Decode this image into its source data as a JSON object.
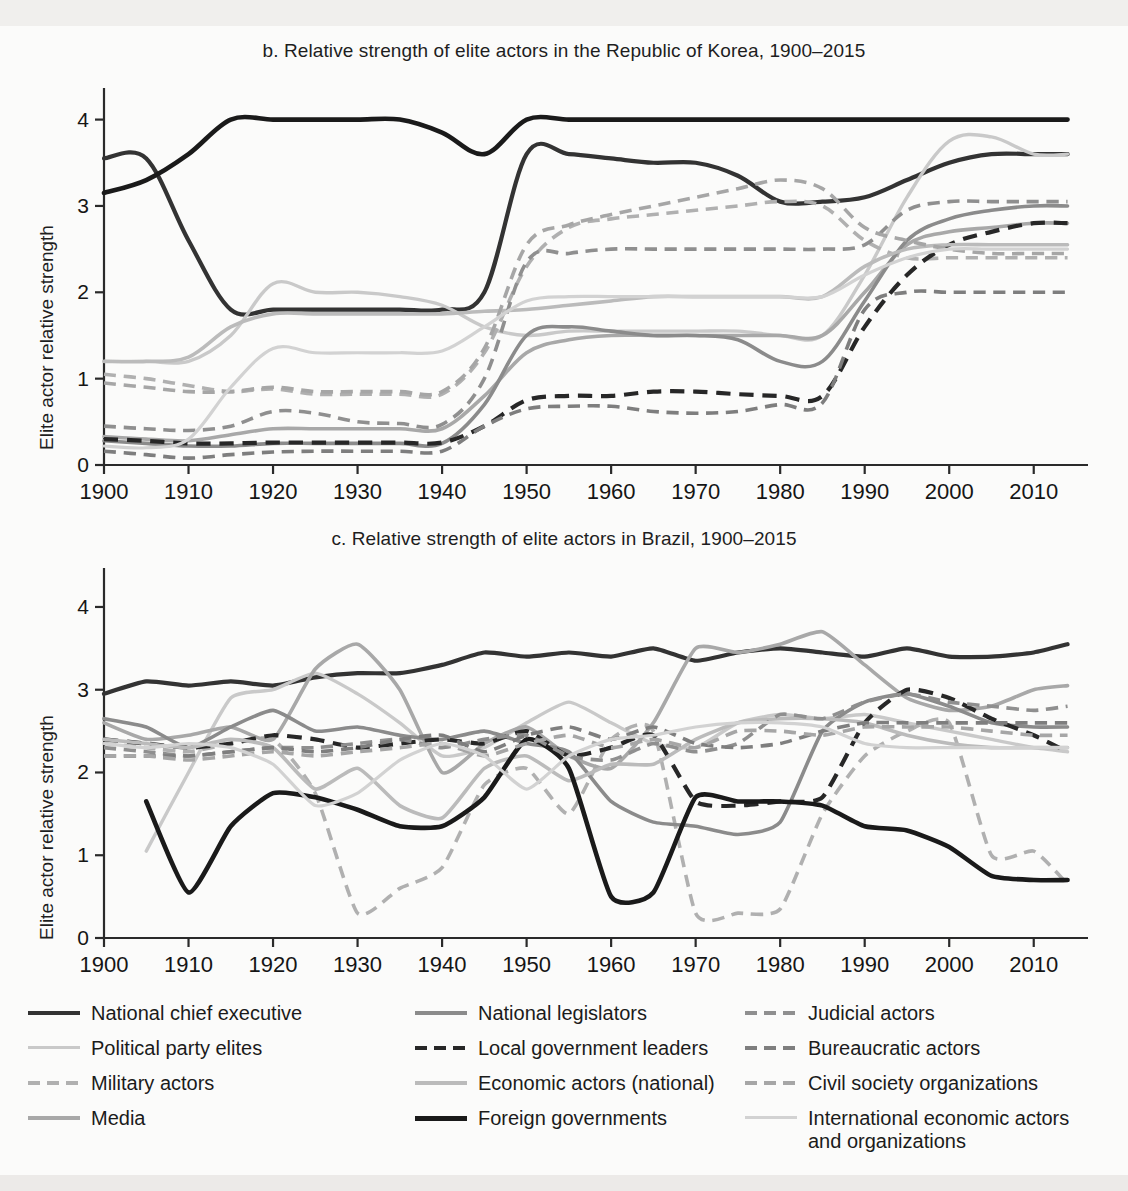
{
  "figure": {
    "background": "#fbfbfa",
    "panels": [
      {
        "id": "korea",
        "title": "b. Relative strength of elite actors in the Republic of Korea, 1900–2015",
        "ylabel": "Elite actor relative strength"
      },
      {
        "id": "brazil",
        "title": "c. Relative strength of elite actors in Brazil, 1900–2015",
        "ylabel": "Elite actor relative strength"
      }
    ]
  },
  "legend": {
    "columns": [
      {
        "items": [
          {
            "label": "National chief executive",
            "style": "solid",
            "color": "#333333",
            "width": 4.2
          },
          {
            "label": "Political party elites",
            "style": "solid",
            "color": "#c9c9c9",
            "width": 3.4
          },
          {
            "label": "Military actors",
            "style": "dashed",
            "color": "#b0b0b0",
            "width": 3.6
          },
          {
            "label": "Media",
            "style": "solid",
            "color": "#a8a8a8",
            "width": 3.6
          }
        ]
      },
      {
        "items": [
          {
            "label": "National legislators",
            "style": "solid",
            "color": "#8b8b8b",
            "width": 3.6
          },
          {
            "label": "Local government leaders",
            "style": "dashed",
            "color": "#272727",
            "width": 4.2
          },
          {
            "label": "Economic actors (national)",
            "style": "solid",
            "color": "#bbbbbb",
            "width": 3.6
          },
          {
            "label": "Foreign governments",
            "style": "solid",
            "color": "#1a1a1a",
            "width": 4.6
          }
        ]
      },
      {
        "items": [
          {
            "label": "Judicial actors",
            "style": "dashed",
            "color": "#8f8f8f",
            "width": 3.6
          },
          {
            "label": "Bureaucratic actors",
            "style": "dashed",
            "color": "#7e7e7e",
            "width": 3.6
          },
          {
            "label": "Civil society organizations",
            "style": "dashed",
            "color": "#a6a6a6",
            "width": 3.6
          },
          {
            "label": "International economic actors\nand organizations",
            "style": "solid",
            "color": "#d2d2d2",
            "width": 3.2
          }
        ]
      }
    ]
  },
  "chart_data": [
    {
      "id": "korea",
      "type": "line",
      "title": "b. Relative strength of elite actors in the Republic of Korea, 1900–2015",
      "xlabel": "",
      "ylabel": "Elite actor relative strength",
      "xlim": [
        1900,
        2015
      ],
      "ylim": [
        0,
        4.25
      ],
      "xticks": [
        1900,
        1910,
        1920,
        1930,
        1940,
        1950,
        1960,
        1970,
        1980,
        1990,
        2000,
        2010
      ],
      "yticks": [
        0,
        1,
        2,
        3,
        4
      ],
      "grid": false,
      "legend_position": "below-figure",
      "x": [
        1900,
        1905,
        1910,
        1915,
        1920,
        1925,
        1930,
        1935,
        1940,
        1945,
        1950,
        1955,
        1960,
        1965,
        1970,
        1975,
        1980,
        1985,
        1990,
        1995,
        2000,
        2005,
        2010,
        2014
      ],
      "series": [
        {
          "name": "National chief executive",
          "style": "solid",
          "color": "#333333",
          "width": 4.2,
          "values": [
            3.55,
            3.55,
            2.6,
            1.8,
            1.8,
            1.8,
            1.8,
            1.8,
            1.8,
            2.0,
            3.6,
            3.6,
            3.55,
            3.5,
            3.5,
            3.35,
            3.05,
            3.05,
            3.1,
            3.3,
            3.5,
            3.6,
            3.6,
            3.6
          ]
        },
        {
          "name": "Political party elites",
          "style": "solid",
          "color": "#c9c9c9",
          "width": 3.4,
          "values": [
            1.2,
            1.2,
            1.2,
            1.5,
            2.1,
            2.0,
            2.0,
            1.95,
            1.85,
            1.6,
            1.5,
            1.55,
            1.55,
            1.55,
            1.55,
            1.55,
            1.5,
            1.5,
            2.2,
            3.1,
            3.75,
            3.8,
            3.6,
            3.6
          ]
        },
        {
          "name": "Military actors",
          "style": "dashed",
          "color": "#b0b0b0",
          "width": 3.6,
          "values": [
            1.05,
            1.0,
            0.92,
            0.85,
            0.88,
            0.82,
            0.82,
            0.82,
            0.82,
            1.3,
            2.3,
            2.75,
            2.85,
            2.9,
            2.95,
            3.0,
            3.05,
            3.0,
            2.6,
            2.4,
            2.4,
            2.4,
            2.4,
            2.4
          ]
        },
        {
          "name": "Media",
          "style": "solid",
          "color": "#a8a8a8",
          "width": 3.6,
          "values": [
            0.33,
            0.3,
            0.28,
            0.35,
            0.42,
            0.42,
            0.42,
            0.42,
            0.42,
            0.8,
            1.3,
            1.45,
            1.5,
            1.5,
            1.5,
            1.5,
            1.5,
            1.5,
            2.0,
            2.55,
            2.7,
            2.75,
            2.8,
            2.8
          ]
        },
        {
          "name": "National legislators",
          "style": "solid",
          "color": "#8b8b8b",
          "width": 3.6,
          "values": [
            0.28,
            0.25,
            0.22,
            0.22,
            0.25,
            0.25,
            0.25,
            0.25,
            0.25,
            0.7,
            1.5,
            1.6,
            1.55,
            1.5,
            1.5,
            1.45,
            1.2,
            1.2,
            1.9,
            2.6,
            2.85,
            2.95,
            3.0,
            3.0
          ]
        },
        {
          "name": "Local government leaders",
          "style": "dashed",
          "color": "#272727",
          "width": 4.2,
          "values": [
            0.3,
            0.28,
            0.25,
            0.25,
            0.26,
            0.26,
            0.26,
            0.26,
            0.26,
            0.45,
            0.75,
            0.8,
            0.8,
            0.85,
            0.85,
            0.82,
            0.8,
            0.8,
            1.6,
            2.2,
            2.55,
            2.7,
            2.8,
            2.8
          ]
        },
        {
          "name": "Economic actors (national)",
          "style": "solid",
          "color": "#bbbbbb",
          "width": 3.6,
          "values": [
            1.2,
            1.2,
            1.25,
            1.6,
            1.75,
            1.75,
            1.75,
            1.75,
            1.75,
            1.78,
            1.8,
            1.85,
            1.9,
            1.95,
            1.95,
            1.95,
            1.95,
            1.95,
            2.3,
            2.5,
            2.55,
            2.55,
            2.55,
            2.55
          ]
        },
        {
          "name": "Foreign governments",
          "style": "solid",
          "color": "#1a1a1a",
          "width": 4.6,
          "values": [
            3.15,
            3.3,
            3.6,
            4.0,
            4.0,
            4.0,
            4.0,
            4.0,
            3.85,
            3.6,
            4.0,
            4.0,
            4.0,
            4.0,
            4.0,
            4.0,
            4.0,
            4.0,
            4.0,
            4.0,
            4.0,
            4.0,
            4.0,
            4.0
          ]
        },
        {
          "name": "Judicial actors",
          "style": "dashed",
          "color": "#8f8f8f",
          "width": 3.6,
          "values": [
            0.45,
            0.42,
            0.4,
            0.45,
            0.62,
            0.6,
            0.5,
            0.48,
            0.47,
            1.0,
            2.35,
            2.45,
            2.5,
            2.5,
            2.5,
            2.5,
            2.5,
            2.5,
            2.55,
            2.95,
            3.05,
            3.05,
            3.05,
            3.05
          ]
        },
        {
          "name": "Bureaucratic actors",
          "style": "dashed",
          "color": "#7e7e7e",
          "width": 3.6,
          "values": [
            0.16,
            0.12,
            0.08,
            0.12,
            0.15,
            0.16,
            0.16,
            0.16,
            0.16,
            0.45,
            0.65,
            0.68,
            0.68,
            0.62,
            0.6,
            0.62,
            0.7,
            0.72,
            1.8,
            2.0,
            2.0,
            2.0,
            2.0,
            2.0
          ]
        },
        {
          "name": "Civil society organizations",
          "style": "dashed",
          "color": "#a6a6a6",
          "width": 3.6,
          "values": [
            0.95,
            0.9,
            0.85,
            0.85,
            0.9,
            0.85,
            0.85,
            0.85,
            0.85,
            1.35,
            2.55,
            2.78,
            2.9,
            3.0,
            3.1,
            3.2,
            3.3,
            3.2,
            2.75,
            2.6,
            2.5,
            2.45,
            2.45,
            2.45
          ]
        },
        {
          "name": "International economic actors and organizations",
          "style": "solid",
          "color": "#d2d2d2",
          "width": 3.2,
          "values": [
            0.22,
            0.2,
            0.3,
            0.9,
            1.35,
            1.3,
            1.3,
            1.3,
            1.32,
            1.6,
            1.9,
            1.95,
            1.95,
            1.95,
            1.95,
            1.95,
            1.95,
            1.95,
            2.2,
            2.4,
            2.5,
            2.5,
            2.5,
            2.5
          ]
        }
      ]
    },
    {
      "id": "brazil",
      "type": "line",
      "title": "c. Relative strength of elite actors in Brazil, 1900–2015",
      "xlabel": "",
      "ylabel": "Elite actor relative strength",
      "xlim": [
        1900,
        2015
      ],
      "ylim": [
        0,
        4.35
      ],
      "xticks": [
        1900,
        1910,
        1920,
        1930,
        1940,
        1950,
        1960,
        1970,
        1980,
        1990,
        2000,
        2010
      ],
      "yticks": [
        0,
        1,
        2,
        3,
        4
      ],
      "grid": false,
      "legend_position": "below-figure",
      "x": [
        1900,
        1905,
        1910,
        1915,
        1920,
        1925,
        1930,
        1935,
        1940,
        1945,
        1950,
        1955,
        1960,
        1965,
        1970,
        1975,
        1980,
        1985,
        1990,
        1995,
        2000,
        2005,
        2010,
        2014
      ],
      "series": [
        {
          "name": "National chief executive",
          "style": "solid",
          "color": "#333333",
          "width": 4.2,
          "values": [
            2.95,
            3.1,
            3.05,
            3.1,
            3.05,
            3.15,
            3.2,
            3.2,
            3.3,
            3.45,
            3.4,
            3.45,
            3.4,
            3.5,
            3.35,
            3.45,
            3.5,
            3.45,
            3.4,
            3.5,
            3.4,
            3.4,
            3.45,
            3.55
          ]
        },
        {
          "name": "Political party elites",
          "style": "solid",
          "color": "#c9c9c9",
          "width": 3.4,
          "values": [
            null,
            1.05,
            2.0,
            2.9,
            3.0,
            3.2,
            2.95,
            2.6,
            2.2,
            2.3,
            2.6,
            2.85,
            2.6,
            2.35,
            2.3,
            2.6,
            2.7,
            2.65,
            2.7,
            2.6,
            2.5,
            2.4,
            2.3,
            2.25
          ]
        },
        {
          "name": "Military actors",
          "style": "dashed",
          "color": "#b0b0b0",
          "width": 3.6,
          "values": [
            2.35,
            2.3,
            2.25,
            2.35,
            2.4,
            1.75,
            0.3,
            0.6,
            0.85,
            1.85,
            2.05,
            1.5,
            2.4,
            2.5,
            0.3,
            0.3,
            0.35,
            1.5,
            2.2,
            2.5,
            2.6,
            1.0,
            1.05,
            0.65
          ]
        },
        {
          "name": "Media",
          "style": "solid",
          "color": "#a8a8a8",
          "width": 3.6,
          "values": [
            2.6,
            2.4,
            2.45,
            2.55,
            2.4,
            3.25,
            3.55,
            3.0,
            2.0,
            2.35,
            2.55,
            2.2,
            2.05,
            2.6,
            3.5,
            3.45,
            3.55,
            3.7,
            3.3,
            2.9,
            2.75,
            2.8,
            3.0,
            3.05
          ]
        },
        {
          "name": "National legislators",
          "style": "solid",
          "color": "#8b8b8b",
          "width": 3.6,
          "values": [
            2.65,
            2.55,
            2.3,
            2.55,
            2.75,
            2.5,
            2.55,
            2.45,
            2.4,
            2.5,
            2.35,
            2.25,
            1.65,
            1.4,
            1.35,
            1.25,
            1.4,
            2.5,
            2.85,
            2.95,
            2.8,
            2.6,
            2.55,
            2.55
          ]
        },
        {
          "name": "Local government leaders",
          "style": "dashed",
          "color": "#272727",
          "width": 4.2,
          "values": [
            2.4,
            2.35,
            2.3,
            2.35,
            2.45,
            2.4,
            2.3,
            2.35,
            2.4,
            2.35,
            2.5,
            2.2,
            2.3,
            2.45,
            1.65,
            1.6,
            1.65,
            1.7,
            2.6,
            3.0,
            2.9,
            2.65,
            2.45,
            2.25
          ]
        },
        {
          "name": "Economic actors (national)",
          "style": "solid",
          "color": "#bbbbbb",
          "width": 3.6,
          "values": [
            2.4,
            2.35,
            2.3,
            2.4,
            2.3,
            1.8,
            2.05,
            1.6,
            1.45,
            2.05,
            2.2,
            1.9,
            2.1,
            2.1,
            2.4,
            2.6,
            2.65,
            2.65,
            2.6,
            2.45,
            2.35,
            2.3,
            2.3,
            2.3
          ]
        },
        {
          "name": "Foreign governments",
          "style": "solid",
          "color": "#1a1a1a",
          "width": 4.6,
          "values": [
            null,
            1.65,
            0.55,
            1.35,
            1.75,
            1.7,
            1.55,
            1.35,
            1.35,
            1.7,
            2.4,
            2.05,
            0.5,
            0.55,
            1.7,
            1.65,
            1.65,
            1.6,
            1.35,
            1.3,
            1.1,
            0.75,
            0.7,
            0.7
          ]
        },
        {
          "name": "Judicial actors",
          "style": "dashed",
          "color": "#8f8f8f",
          "width": 3.6,
          "values": [
            2.3,
            2.25,
            2.2,
            2.25,
            2.3,
            2.3,
            2.35,
            2.4,
            2.3,
            2.4,
            2.45,
            2.2,
            2.15,
            2.35,
            2.25,
            2.35,
            2.7,
            2.65,
            2.85,
            2.95,
            2.85,
            2.8,
            2.75,
            2.8
          ]
        },
        {
          "name": "Bureaucratic actors",
          "style": "dashed",
          "color": "#7e7e7e",
          "width": 3.6,
          "values": [
            2.2,
            2.2,
            2.2,
            2.25,
            2.3,
            2.25,
            2.3,
            2.4,
            2.45,
            2.25,
            2.45,
            2.55,
            2.4,
            2.55,
            2.35,
            2.3,
            2.35,
            2.5,
            2.6,
            2.6,
            2.6,
            2.6,
            2.6,
            2.6
          ]
        },
        {
          "name": "Civil society organizations",
          "style": "dashed",
          "color": "#a6a6a6",
          "width": 3.6,
          "values": [
            2.2,
            2.2,
            2.15,
            2.2,
            2.25,
            2.2,
            2.25,
            2.3,
            2.35,
            2.2,
            2.35,
            2.45,
            2.3,
            2.4,
            2.3,
            2.5,
            2.5,
            2.45,
            2.55,
            2.55,
            2.55,
            2.5,
            2.45,
            2.45
          ]
        },
        {
          "name": "International economic actors and organizations",
          "style": "solid",
          "color": "#d2d2d2",
          "width": 3.2,
          "values": [
            2.35,
            2.3,
            2.35,
            2.3,
            2.1,
            1.6,
            1.75,
            2.15,
            2.35,
            2.2,
            1.8,
            2.2,
            2.4,
            2.45,
            2.55,
            2.6,
            2.6,
            2.55,
            2.35,
            2.3,
            2.3,
            2.3,
            2.3,
            2.3
          ]
        }
      ]
    }
  ]
}
